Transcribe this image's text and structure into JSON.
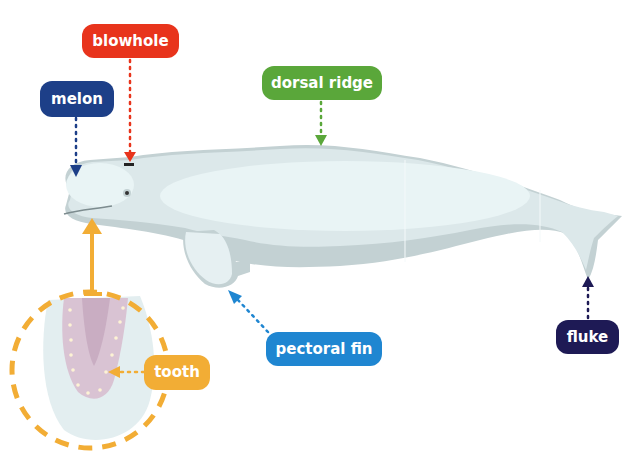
{
  "diagram": {
    "colors": {
      "background": "#ffffff",
      "body_outline": "#c3d1d3",
      "body_main": "#dce8ea",
      "body_highlight": "#e9f4f5",
      "tooth_gum": "#d9c3d3",
      "tooth_dashed_circle": "#f2ad35"
    },
    "labels": [
      {
        "id": "blowhole",
        "text": "blowhole",
        "color": "#e8341c"
      },
      {
        "id": "melon",
        "text": "melon",
        "color": "#1d3f88"
      },
      {
        "id": "dorsal_ridge",
        "text": "dorsal ridge",
        "color": "#5aa73a"
      },
      {
        "id": "fluke",
        "text": "fluke",
        "color": "#1e1a55"
      },
      {
        "id": "pectoral_fin",
        "text": "pectoral fin",
        "color": "#1f86d1"
      },
      {
        "id": "tooth",
        "text": "tooth",
        "color": "#f2ad35"
      }
    ]
  }
}
